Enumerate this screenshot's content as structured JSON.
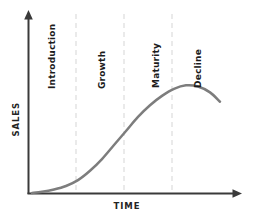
{
  "chart_data": {
    "type": "line",
    "title": "",
    "subtitle": "",
    "xlabel": "TIME",
    "ylabel": "SALES",
    "xlim": [
      0,
      100
    ],
    "ylim": [
      0,
      100
    ],
    "grid": false,
    "legend": "none",
    "axis_ticks": {
      "x": [],
      "y": []
    },
    "series": [
      {
        "name": "Sales",
        "color": "#7d7d7d",
        "x": [
          1,
          6,
          12,
          18,
          24,
          30,
          36,
          42,
          48,
          54,
          60,
          66,
          72,
          78,
          84,
          90,
          95
        ],
        "y": [
          0,
          1,
          3,
          6,
          11,
          19,
          29,
          41,
          53,
          65,
          75,
          83,
          89,
          92,
          91,
          86,
          78
        ]
      }
    ],
    "stage_boundaries": [
      23,
      47,
      71
    ],
    "stages": [
      {
        "name": "Introduction",
        "x_start": 0,
        "x_end": 23
      },
      {
        "name": "Growth",
        "x_start": 23,
        "x_end": 47
      },
      {
        "name": "Maturity",
        "x_start": 47,
        "x_end": 71
      },
      {
        "name": "Decline",
        "x_start": 71,
        "x_end": 100
      }
    ],
    "annotations": [
      {
        "text": "Introduction",
        "rotation": -90
      },
      {
        "text": "Growth",
        "rotation": -90
      },
      {
        "text": "Maturity",
        "rotation": -90
      },
      {
        "text": "Decline",
        "rotation": -90
      }
    ],
    "colors": {
      "curve": "#7d7d7d",
      "axis": "#3a3a3a",
      "divider": "#d9d9d9",
      "background": "#ffffff",
      "label_text": "#1c1c1c"
    }
  },
  "axes": {
    "y_title": "SALES",
    "x_title": "TIME"
  },
  "stage_labels": {
    "introduction": "Introduction",
    "growth": "Growth",
    "maturity": "Maturity",
    "decline": "Decline"
  }
}
